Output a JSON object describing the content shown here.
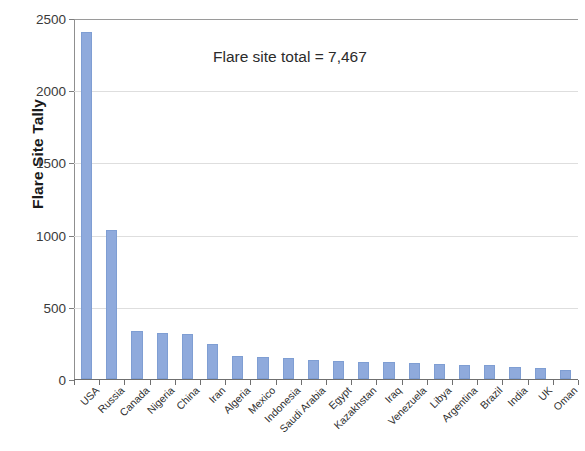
{
  "chart_data": {
    "type": "bar",
    "title": "",
    "xlabel": "",
    "ylabel": "Flare Site Tally",
    "ylim": [
      0,
      2500
    ],
    "ytick_labels": [
      "0",
      "500",
      "1000",
      "1500",
      "2000",
      "2500"
    ],
    "ytick_values": [
      0,
      500,
      1000,
      1500,
      2000,
      2500
    ],
    "grid": true,
    "legend": "none",
    "bar_color": "#8FAADC",
    "annotations": [
      "Flare site total = 7,467"
    ],
    "categories": [
      "USA",
      "Russia",
      "Canada",
      "Nigeria",
      "China",
      "Iran",
      "Algeria",
      "Mexico",
      "Indonesia",
      "Saudi Arabia",
      "Egypt",
      "Kazakhstan",
      "Iraq",
      "Venezuela",
      "Libya",
      "Argentina",
      "Brazil",
      "India",
      "UK",
      "Oman"
    ],
    "values": [
      2400,
      1030,
      330,
      320,
      310,
      240,
      160,
      150,
      145,
      135,
      125,
      120,
      115,
      110,
      105,
      100,
      95,
      80,
      75,
      65
    ]
  },
  "annotation": {
    "total_text": "Flare site total = 7,467"
  },
  "axis": {
    "y_title": "Flare Site Tally"
  }
}
